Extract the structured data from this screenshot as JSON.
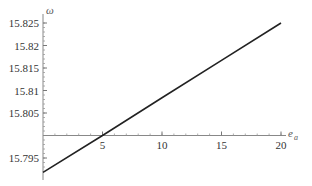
{
  "chart_data": {
    "type": "line",
    "title": "",
    "xlabel": "e_a",
    "ylabel": "ω",
    "xlim": [
      0,
      20
    ],
    "ylim": [
      15.7915,
      15.826
    ],
    "x_axis_crosses_y_at": 15.8,
    "grid": false,
    "legend": null,
    "x_ticks": [
      5,
      10,
      15,
      20
    ],
    "x_tick_labels": [
      "5",
      "10",
      "15",
      "20"
    ],
    "y_ticks": [
      15.795,
      15.805,
      15.81,
      15.815,
      15.82,
      15.825
    ],
    "y_tick_labels": [
      "15.795",
      "15.805",
      "15.81",
      "15.815",
      "15.82",
      "15.825"
    ],
    "series": [
      {
        "name": "ω(e_a)",
        "x": [
          0,
          5,
          10,
          15,
          20
        ],
        "y": [
          15.7918,
          15.8,
          15.8084,
          15.8167,
          15.825
        ]
      }
    ],
    "color": "#222222"
  },
  "labels": {
    "xlabel_base": "e",
    "xlabel_sub": "a",
    "ylabel": "ω"
  }
}
